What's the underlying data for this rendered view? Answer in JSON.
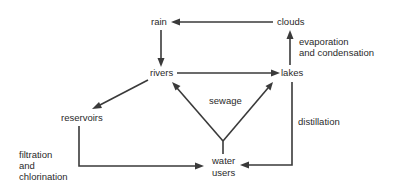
{
  "nodes": {
    "rain": "rain",
    "clouds": "clouds",
    "rivers": "rivers",
    "lakes": "lakes",
    "reservoirs": "reservoirs",
    "water_users_line1": "water",
    "water_users_line2": "users"
  },
  "edge_labels": {
    "evaporation_line1": "evaporation",
    "evaporation_line2": "and condensation",
    "sewage": "sewage",
    "distillation": "distillation",
    "filtration_line1": "filtration",
    "filtration_line2": "and",
    "filtration_line3": "chlorination"
  },
  "edges": [
    {
      "from": "clouds",
      "to": "rain"
    },
    {
      "from": "rain",
      "to": "rivers"
    },
    {
      "from": "rivers",
      "to": "lakes"
    },
    {
      "from": "lakes",
      "to": "clouds",
      "label": "evaporation and condensation"
    },
    {
      "from": "rivers",
      "to": "reservoirs"
    },
    {
      "from": "reservoirs",
      "to": "water users",
      "label": "filtration and chlorination"
    },
    {
      "from": "water users",
      "to": "rivers",
      "label": "sewage"
    },
    {
      "from": "water users",
      "to": "lakes",
      "label": "sewage"
    },
    {
      "from": "lakes",
      "to": "water users",
      "label": "distillation"
    }
  ],
  "colors": {
    "line": "#3a3a3a",
    "text": "#2a2a2a",
    "background": "#ffffff"
  }
}
